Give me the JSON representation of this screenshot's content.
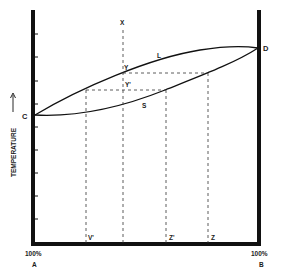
{
  "diagram": {
    "type": "phase-diagram",
    "y_axis": {
      "label": "TEMPERATURE",
      "arrow": "up"
    },
    "x_axis": {
      "left_label_pct": "100%",
      "left_label_comp": "A",
      "right_label_pct": "100%",
      "right_label_comp": "B"
    },
    "points": {
      "C": "C",
      "D": "D",
      "X": "X",
      "Y": "Y",
      "Y_prime": "Y'",
      "V_prime": "V'",
      "Z_prime": "Z'",
      "Z": "Z"
    },
    "curves": {
      "upper": "L",
      "lower": "S"
    },
    "colors": {
      "ink": "#1a1a1a",
      "background": "#ffffff"
    }
  }
}
